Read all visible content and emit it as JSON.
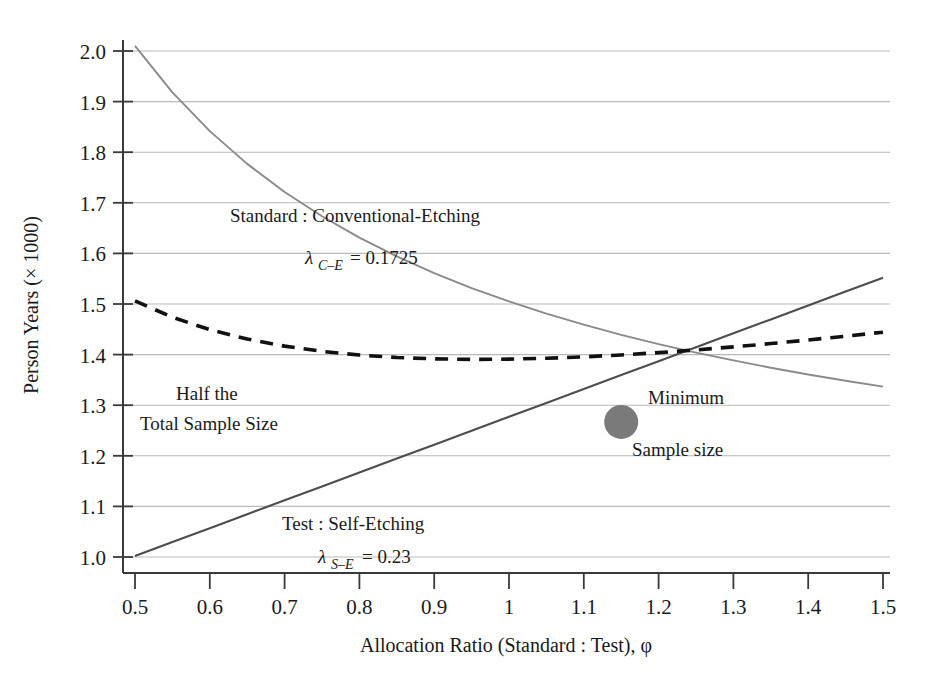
{
  "chart_data": {
    "type": "line",
    "title": "",
    "xlabel": "Allocation Ratio (Standard : Test), φ",
    "ylabel": "Person Years (× 1000)",
    "xlim": [
      0.5,
      1.5
    ],
    "ylim": [
      1.0,
      2.0
    ],
    "grid": true,
    "legend": "none (inline annotations)",
    "xticks": [
      "0.5",
      "0.6",
      "0.7",
      "0.8",
      "0.9",
      "1",
      "1.1",
      "1.2",
      "1.3",
      "1.4",
      "1.5"
    ],
    "xtick_values": [
      0.5,
      0.6,
      0.7,
      0.8,
      0.9,
      1.0,
      1.1,
      1.2,
      1.3,
      1.4,
      1.5
    ],
    "yticks": [
      "1.0",
      "1.1",
      "1.2",
      "1.3",
      "1.4",
      "1.5",
      "1.6",
      "1.7",
      "1.8",
      "1.9",
      "2.0"
    ],
    "ytick_values": [
      1.0,
      1.1,
      1.2,
      1.3,
      1.4,
      1.5,
      1.6,
      1.7,
      1.8,
      1.9,
      2.0
    ],
    "x": [
      0.5,
      0.55,
      0.6,
      0.65,
      0.7,
      0.75,
      0.8,
      0.85,
      0.9,
      0.95,
      1.0,
      1.05,
      1.1,
      1.15,
      1.2,
      1.25,
      1.3,
      1.35,
      1.4,
      1.45,
      1.5
    ],
    "series": [
      {
        "name": "Standard : Conventional-Etching",
        "style": "solid-light",
        "color": "#8a8a8a",
        "values": [
          2.01,
          1.905,
          1.815,
          1.738,
          1.672,
          1.613,
          1.562,
          1.516,
          1.475,
          1.438,
          1.404,
          1.373,
          1.345,
          1.319,
          1.295,
          1.272,
          1.251,
          1.232,
          1.213,
          1.196,
          1.18
        ]
      },
      {
        "name": "Test : Self-Etching",
        "style": "solid-dark",
        "color": "#4d4d4d",
        "values": [
          1.002,
          1.057,
          1.111,
          1.166,
          1.22,
          1.275,
          1.33,
          1.384,
          1.439,
          1.493,
          1.548,
          1.602,
          1.657,
          1.711,
          1.766,
          1.82,
          1.875,
          1.929,
          1.984,
          2.038,
          2.093
        ]
      },
      {
        "name": "Half the Total Sample Size",
        "style": "dashed",
        "color": "#111111",
        "values": [
          1.506,
          1.481,
          1.463,
          1.452,
          1.446,
          1.444,
          1.446,
          1.45,
          1.457,
          1.466,
          1.476,
          1.488,
          1.501,
          1.515,
          1.53,
          1.546,
          1.563,
          1.58,
          1.598,
          1.617,
          1.636
        ]
      }
    ],
    "annotations": [
      {
        "name": "standard-label-line1",
        "text": "Standard : Conventional-Etching",
        "x": 0.78,
        "y": 1.695
      },
      {
        "name": "standard-lambda",
        "text": "λ",
        "sub": "C–E",
        "eq": "= 0.1725",
        "x": 0.86,
        "y": 1.628
      },
      {
        "name": "test-label-line1",
        "text": "Test : Self-Etching",
        "x": 0.78,
        "y": 1.082
      },
      {
        "name": "test-lambda",
        "text": "λ",
        "sub": "S–E",
        "eq": "= 0.23",
        "x": 0.86,
        "y": 1.016
      },
      {
        "name": "half-total-line1",
        "text": "Half the",
        "x": 0.66,
        "y": 1.345
      },
      {
        "name": "half-total-line2",
        "text": "Total Sample Size",
        "x": 0.66,
        "y": 1.298
      },
      {
        "name": "minimum-line1",
        "text": "Minimum",
        "x": 1.25,
        "y": 1.3
      },
      {
        "name": "minimum-line2",
        "text": "Sample size",
        "x": 1.22,
        "y": 1.222
      }
    ],
    "markers": [
      {
        "name": "minimum-sample-size-marker",
        "x": 1.15,
        "y": 1.267,
        "color": "#7a7a7a",
        "shape": "circle",
        "radius_px": 17
      }
    ],
    "lambda_values": {
      "conventional_etching": "0.1725",
      "self_etching": "0.23"
    }
  },
  "axis": {
    "x_title": "Allocation Ratio (Standard : Test), φ",
    "y_title": "Person Years (× 1000)"
  },
  "colors": {
    "grid": "#b9b9b9",
    "axis": "#3a3a3a",
    "standard_curve": "#8a8a8a",
    "test_curve": "#4d4d4d",
    "half_total_curve": "#111111",
    "marker": "#7a7a7a",
    "background": "#ffffff"
  }
}
